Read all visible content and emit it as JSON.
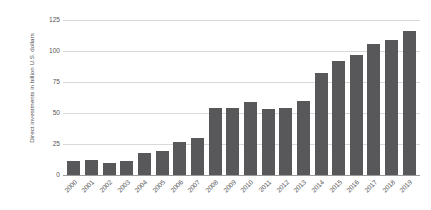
{
  "chart_data": {
    "type": "bar",
    "title": "",
    "subtitle": "",
    "xlabel": "",
    "ylabel": "Direct investments in billion U.S. dollars",
    "categories": [
      "2000",
      "2001",
      "2002",
      "2003",
      "2004",
      "2005",
      "2006",
      "2007",
      "2008",
      "2009",
      "2010",
      "2011",
      "2012",
      "2013",
      "2014",
      "2015",
      "2016",
      "2017",
      "2018",
      "2019"
    ],
    "values": [
      11,
      12,
      10,
      11,
      18,
      19,
      27,
      30,
      54,
      54,
      59,
      53,
      54,
      60,
      82,
      92,
      97,
      106,
      109,
      116
    ],
    "ylim": [
      0,
      125
    ],
    "yticks": [
      0,
      25,
      50,
      75,
      100,
      125
    ],
    "ytick_labels": [
      "0",
      "25",
      "50",
      "75",
      "100",
      "125"
    ],
    "grid": true,
    "legend": false,
    "legend_position": "none",
    "bar_color": "#58585a",
    "gridline_color": "#d9d9d9",
    "axis_color": "#9a9a9a",
    "background_color": "#ffffff",
    "text_color": "#58585a"
  }
}
